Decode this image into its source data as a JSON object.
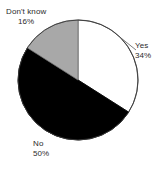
{
  "chart_data": {
    "type": "pie",
    "title": "",
    "categories": [
      "Yes",
      "No",
      "Don't know"
    ],
    "values": [
      34,
      50,
      16
    ],
    "unit": "%",
    "start_angle_deg": 0,
    "direction": "clockwise",
    "legend": "none",
    "labels_position": "outside",
    "slices": [
      {
        "label": "Yes",
        "value": 34,
        "value_text": "34%",
        "color": "#ffffff"
      },
      {
        "label": "No",
        "value": 50,
        "value_text": "50%",
        "color": "#000000"
      },
      {
        "label": "Don't know",
        "value": 16,
        "value_text": "16%",
        "color": "#a8a8a8"
      }
    ]
  },
  "labels": {
    "dont_know": {
      "name": "Don't know",
      "pct": "16%"
    },
    "yes": {
      "name": "Yes",
      "pct": "34%"
    },
    "no": {
      "name": "No",
      "pct": "50%"
    }
  },
  "colors": {
    "background": "#ffffff",
    "outline": "#3a3a3a",
    "slice_yes": "#ffffff",
    "slice_no": "#000000",
    "slice_dont_know": "#a8a8a8",
    "text": "#2b2b2b"
  }
}
